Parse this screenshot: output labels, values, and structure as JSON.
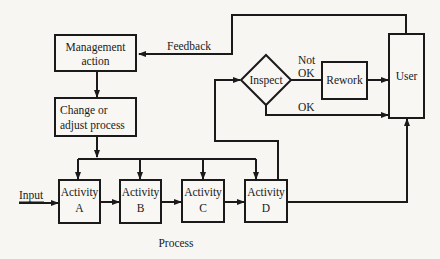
{
  "diagram": {
    "type": "process control flowchart",
    "nodes": {
      "management": {
        "line1": "Management",
        "line2": "action"
      },
      "change": {
        "line1": "Change or",
        "line2": "adjust process"
      },
      "activity_a": {
        "line1": "Activity",
        "line2": "A"
      },
      "activity_b": {
        "line1": "Activity",
        "line2": "B"
      },
      "activity_c": {
        "line1": "Activity",
        "line2": "C"
      },
      "activity_d": {
        "line1": "Activity",
        "line2": "D"
      },
      "inspect": {
        "label": "Inspect"
      },
      "rework": {
        "label": "Rework"
      },
      "user": {
        "label": "User"
      }
    },
    "edge_labels": {
      "input": "Input",
      "feedback": "Feedback",
      "not_ok_1": "Not",
      "not_ok_2": "OK",
      "ok": "OK"
    },
    "caption": "Process",
    "colors": {
      "line": "#1a1a1a",
      "background": "#f7f6f3"
    }
  }
}
